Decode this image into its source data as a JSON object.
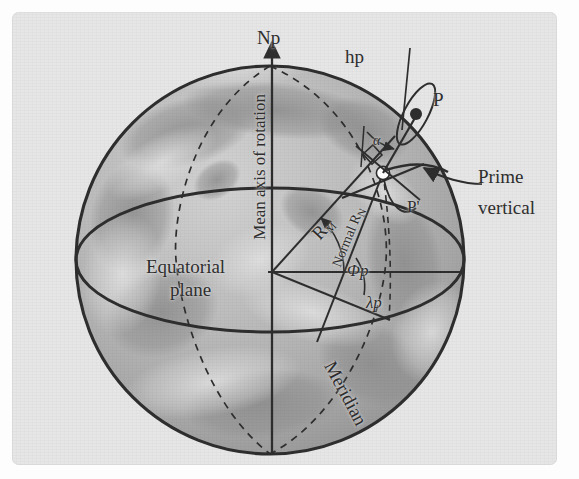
{
  "figure": {
    "kind": "geodesy-reference-ellipsoid-diagram",
    "panel_bg": "#e6e6e6",
    "ink": "#2e2e2e",
    "top_crop_text": "· · ·",
    "labels": {
      "north_pole": "Np",
      "ellipsoid_height": "hp",
      "point_above_surface": "P",
      "point_on_surface": "P'",
      "prime_vertical_line1": "Prime",
      "prime_vertical_line2": "vertical",
      "equatorial_plane_line1": "Equatorial",
      "equatorial_plane_line2": "plane",
      "mean_axis": "Mean axis of rotation",
      "meridian": "Meridian",
      "meridian_radius": "R",
      "meridian_radius_sub": "M",
      "normal_radius": "Normal R",
      "normal_radius_sub": "N",
      "latitude": "Φp",
      "longitude": "λp",
      "deflection_angle": "α"
    },
    "geometry": {
      "globe_center_x": 270,
      "globe_center_y": 260,
      "globe_radius": 194,
      "equator_ellipse_rx": 194,
      "equator_ellipse_ry": 72,
      "origin_x": 272,
      "origin_y": 272,
      "surface_point_x": 383,
      "surface_point_y": 172,
      "space_point_x": 414,
      "space_point_y": 113
    }
  }
}
